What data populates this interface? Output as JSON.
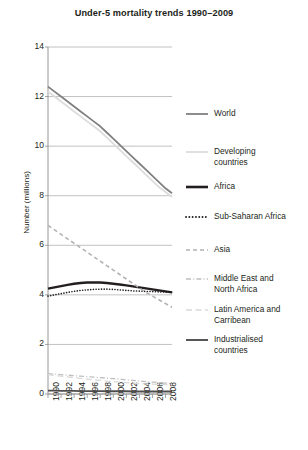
{
  "chart_data": {
    "type": "line",
    "title": "Under-5 mortality trends 1990–2009",
    "xlabel": "",
    "ylabel": "Number (millions)",
    "ylim": [
      0,
      14
    ],
    "ytick_values": [
      0,
      2,
      4,
      6,
      8,
      10,
      12,
      14
    ],
    "ytick_labels": [
      "0",
      "2",
      "4",
      "6",
      "8",
      "10",
      "12",
      "14"
    ],
    "xlim": [
      1990,
      2009
    ],
    "xtick_values": [
      1990,
      1992,
      1994,
      1996,
      1998,
      2000,
      2002,
      2004,
      2006,
      2008
    ],
    "xtick_labels": [
      "1990",
      "1992",
      "1994",
      "1996",
      "1998",
      "2000",
      "2002",
      "2004",
      "2006",
      "2008"
    ],
    "grid": "horizontal",
    "legend_position": "right",
    "x": [
      1990,
      1991,
      1992,
      1993,
      1994,
      1995,
      1996,
      1997,
      1998,
      1999,
      2000,
      2001,
      2002,
      2003,
      2004,
      2005,
      2006,
      2007,
      2008,
      2009
    ],
    "series": [
      {
        "name": "World",
        "color": "#808080",
        "style": "solid",
        "width": 1.8,
        "values": [
          12.4,
          12.2,
          12.0,
          11.8,
          11.6,
          11.4,
          11.2,
          11.0,
          10.8,
          10.55,
          10.3,
          10.05,
          9.8,
          9.55,
          9.3,
          9.05,
          8.8,
          8.55,
          8.3,
          8.1
        ]
      },
      {
        "name": "Developing countries",
        "color": "#dcdcdc",
        "style": "solid",
        "width": 1.8,
        "values": [
          12.2,
          12.0,
          11.8,
          11.6,
          11.4,
          11.2,
          11.0,
          10.8,
          10.6,
          10.35,
          10.1,
          9.85,
          9.6,
          9.35,
          9.1,
          8.85,
          8.6,
          8.35,
          8.15,
          7.95
        ]
      },
      {
        "name": "Africa",
        "color": "#231f20",
        "style": "solid",
        "width": 2.4,
        "values": [
          4.25,
          4.3,
          4.35,
          4.4,
          4.45,
          4.48,
          4.5,
          4.5,
          4.5,
          4.48,
          4.45,
          4.42,
          4.38,
          4.34,
          4.3,
          4.26,
          4.22,
          4.18,
          4.14,
          4.1
        ]
      },
      {
        "name": "Sub-Saharan Africa",
        "color": "#231f20",
        "style": "dotted",
        "width": 1.6,
        "values": [
          3.95,
          4.0,
          4.05,
          4.1,
          4.14,
          4.18,
          4.2,
          4.22,
          4.23,
          4.23,
          4.22,
          4.2,
          4.18,
          4.16,
          4.15,
          4.14,
          4.13,
          4.12,
          4.11,
          4.1
        ]
      },
      {
        "name": "Asia",
        "color": "#b3b3b3",
        "style": "dashed",
        "width": 1.6,
        "values": [
          6.8,
          6.62,
          6.44,
          6.26,
          6.08,
          5.9,
          5.72,
          5.54,
          5.36,
          5.18,
          5.0,
          4.82,
          4.64,
          4.46,
          4.28,
          4.1,
          3.95,
          3.8,
          3.65,
          3.5
        ]
      },
      {
        "name": "Middle East and North Africa",
        "color": "#bfbfbf",
        "style": "dashdot",
        "width": 1.3,
        "values": [
          0.82,
          0.8,
          0.78,
          0.76,
          0.74,
          0.72,
          0.7,
          0.68,
          0.66,
          0.64,
          0.62,
          0.6,
          0.57,
          0.55,
          0.52,
          0.5,
          0.48,
          0.46,
          0.44,
          0.42
        ]
      },
      {
        "name": "Latin America and Carribean",
        "color": "#d9d9d9",
        "style": "longdash",
        "width": 1.3,
        "values": [
          0.78,
          0.75,
          0.72,
          0.69,
          0.66,
          0.63,
          0.6,
          0.57,
          0.55,
          0.52,
          0.5,
          0.48,
          0.46,
          0.44,
          0.42,
          0.41,
          0.4,
          0.39,
          0.38,
          0.37
        ]
      },
      {
        "name": "Industrialised countries",
        "color": "#4d4d4d",
        "style": "solid",
        "width": 1.8,
        "values": [
          0.14,
          0.14,
          0.13,
          0.13,
          0.13,
          0.12,
          0.12,
          0.12,
          0.12,
          0.11,
          0.11,
          0.11,
          0.11,
          0.1,
          0.1,
          0.1,
          0.1,
          0.1,
          0.1,
          0.1
        ]
      }
    ],
    "legend_entries": [
      {
        "label": "World",
        "swatch": "solid-gray"
      },
      {
        "label": "Developing\ncountries",
        "swatch": "solid-light"
      },
      {
        "label": "Africa",
        "swatch": "solid-bold-black"
      },
      {
        "label": "Sub-Saharan Africa",
        "swatch": "dotted-black"
      },
      {
        "label": "Asia",
        "swatch": "dashed-gray"
      },
      {
        "label": "Middle East and\nNorth Africa",
        "swatch": "dashdot-gray"
      },
      {
        "label": "Latin America and\nCarribean",
        "swatch": "longdash-light"
      },
      {
        "label": "Industrialised\ncountries",
        "swatch": "solid-darkgray"
      }
    ]
  },
  "colors": {
    "text": "#231f20",
    "axis": "#8c8c8c",
    "grid": "#a6a6a6",
    "background": "#ffffff"
  }
}
